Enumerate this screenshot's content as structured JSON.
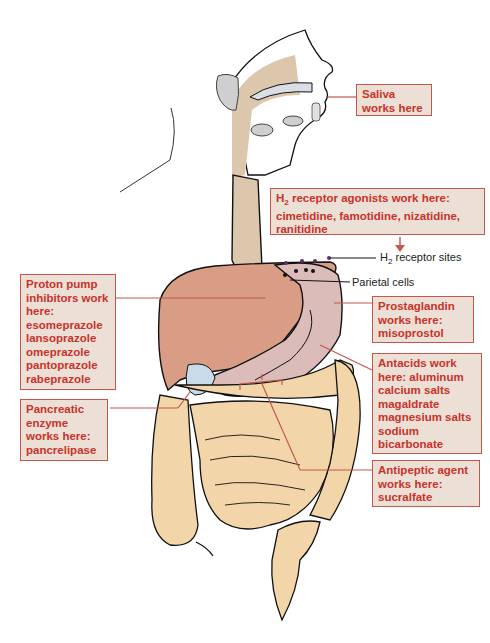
{
  "diagram": {
    "colors": {
      "label_bg": "#ece0d6",
      "label_border": "#c4574c",
      "label_text": "#c8322a",
      "leader_line": "#c4574c",
      "esophagus": "#dcc7ad",
      "liver": "#d99d86",
      "stomach": "#dbbcb8",
      "intestine": "#f2d6a9",
      "salivary_gland": "#cfcfcf"
    },
    "labels": [
      {
        "id": "saliva",
        "text": "Saliva\nworks here"
      },
      {
        "id": "h2",
        "prefix": "H",
        "sub": "2",
        "text": " receptor agonists work here:\ncimetidine, famotidine, nizatidine,\nranitidine"
      },
      {
        "id": "ppi",
        "text": "Proton pump\ninhibitors work\nhere:\nesomeprazole\nlansoprazole\nomeprazole\npantoprazole\nrabeprazole"
      },
      {
        "id": "prostaglandin",
        "text": "Prostaglandin\nworks here:\nmisoprostol"
      },
      {
        "id": "antacids",
        "text": "Antacids work\nhere: aluminum\ncalcium salts\nmagaldrate\nmagnesium salts\nsodium\n  bicarbonate"
      },
      {
        "id": "pancreatic",
        "text": "Pancreatic\nenzyme\nworks here:\npancrelipase"
      },
      {
        "id": "antipeptic",
        "text": "Antipeptic agent\nworks here:\nsucralfate"
      }
    ],
    "annotations": {
      "h2_sites_prefix": "H",
      "h2_sites_sub": "2",
      "h2_sites_text": " receptor sites",
      "parietal_cells": "Parietal cells"
    }
  }
}
